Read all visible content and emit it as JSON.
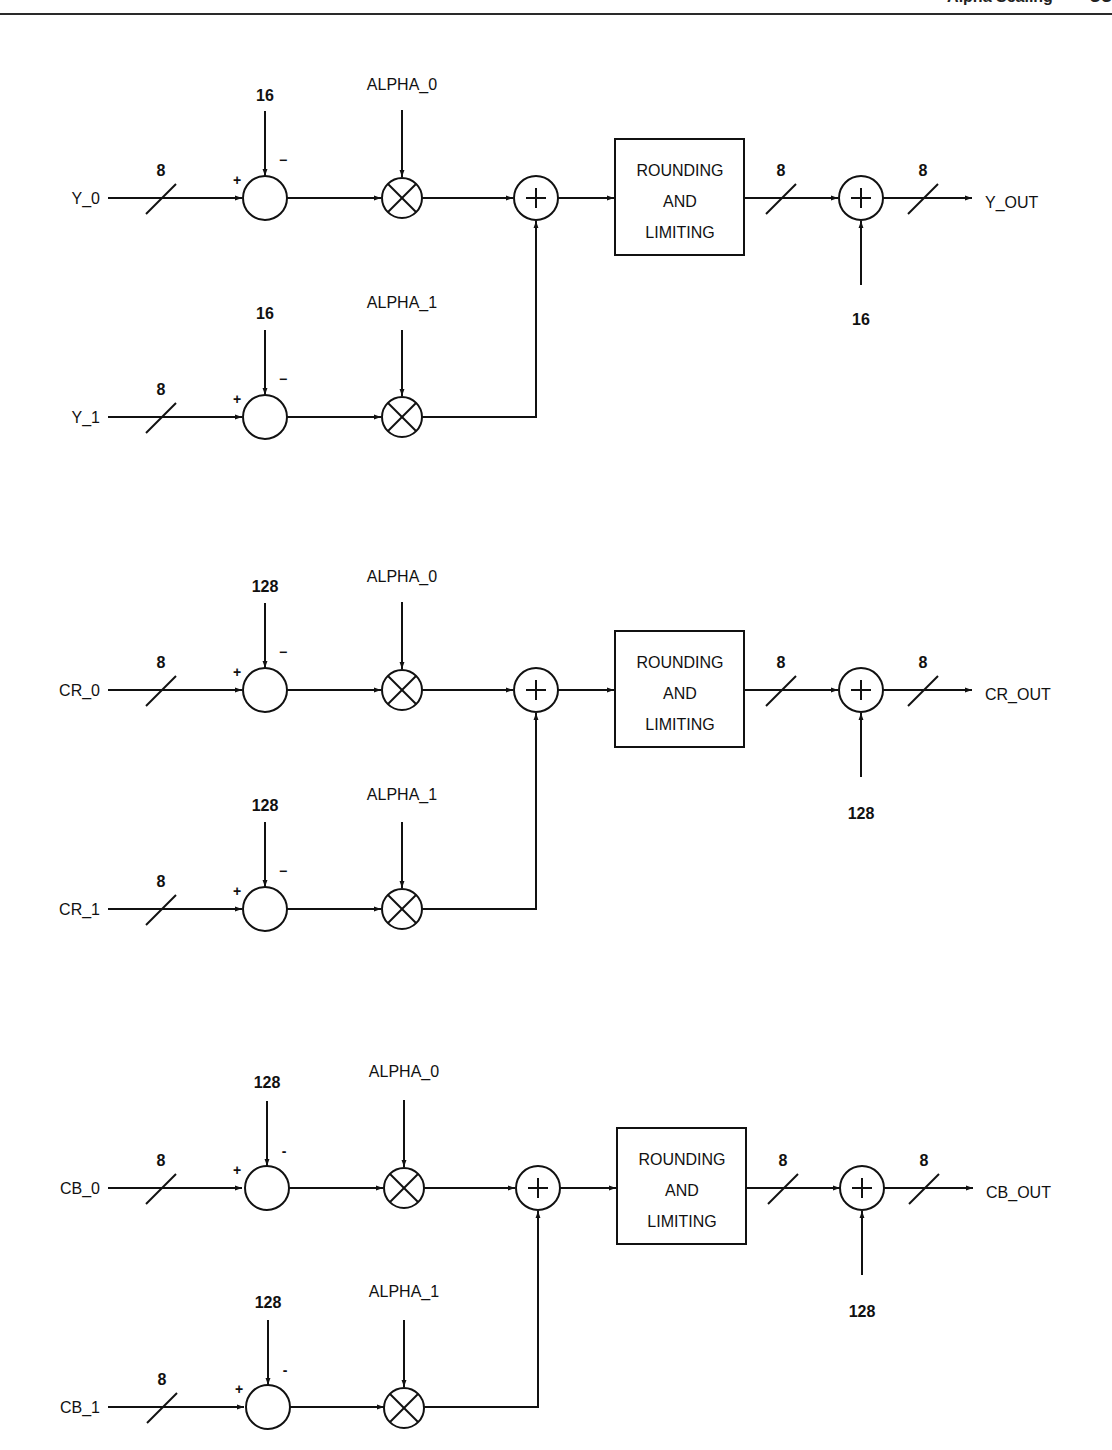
{
  "page_header": {
    "text_left": "Alpha Scaling",
    "text_right": "CC"
  },
  "diagram": {
    "box_label_lines": [
      "ROUNDING",
      "AND",
      "LIMITING"
    ],
    "bus_width": "8",
    "plus_sign": "+",
    "minus_sign": "−",
    "sections": [
      {
        "name": "y",
        "input_0": "Y_0",
        "input_1": "Y_1",
        "offset_0": "16",
        "offset_1": "16",
        "alpha_0": "ALPHA_0",
        "alpha_1": "ALPHA_1",
        "output_offset": "16",
        "output": "Y_OUT",
        "minus_0": "−",
        "minus_1": "−"
      },
      {
        "name": "cr",
        "input_0": "CR_0",
        "input_1": "CR_1",
        "offset_0": "128",
        "offset_1": "128",
        "alpha_0": "ALPHA_0",
        "alpha_1": "ALPHA_1",
        "output_offset": "128",
        "output": "CR_OUT",
        "minus_0": "−",
        "minus_1": "−"
      },
      {
        "name": "cb",
        "input_0": "CB_0",
        "input_1": "CB_1",
        "offset_0": "128",
        "offset_1": "128",
        "alpha_0": "ALPHA_0",
        "alpha_1": "ALPHA_1",
        "output_offset": "128",
        "output": "CB_OUT",
        "minus_0": "-",
        "minus_1": "-"
      }
    ]
  }
}
